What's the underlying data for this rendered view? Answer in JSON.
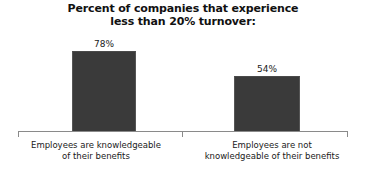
{
  "chart_data": {
    "type": "bar",
    "title": "Percent of companies that experience less than 20% turnover:",
    "title_lines": [
      "Percent of companies that experience",
      "less than 20% turnover:"
    ],
    "categories": [
      "Employees are knowledgeable of their benefits",
      "Employees are not knowledgeable of their benefits"
    ],
    "category_lines": [
      [
        "Employees are knowledgeable",
        "of their benefits"
      ],
      [
        "Employees are not",
        "knowledgeable of their benefits"
      ]
    ],
    "values": [
      78,
      54
    ],
    "value_labels": [
      "78%",
      "54%"
    ],
    "xlabel": "",
    "ylabel": "",
    "ylim": [
      0,
      100
    ],
    "grid": false,
    "legend": false,
    "axis_ticks_visible": true,
    "series": [
      {
        "name": "Percent of companies",
        "values": [
          78,
          54
        ]
      }
    ],
    "colors": {
      "bar_fill": "#3a3a3a",
      "bar_edge": "#555555",
      "axis": "#8a8a8a",
      "text": "#1a1a1a",
      "title_text": "#111111",
      "background": "#ffffff"
    }
  }
}
